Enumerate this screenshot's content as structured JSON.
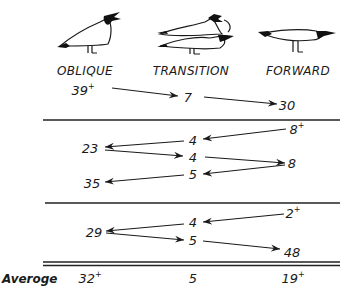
{
  "columns": [
    {
      "key": "oblique",
      "label": "OBLIQUE",
      "icon": "oblique-gull-icon"
    },
    {
      "key": "transition",
      "label": "TRANSITION",
      "icon": "transition-gull-icon"
    },
    {
      "key": "forward",
      "label": "FORWARD",
      "icon": "forward-gull-icon"
    }
  ],
  "blocks": [
    {
      "nodes": [
        {
          "id": "b1_obl",
          "value": "39",
          "sup": "+",
          "column": "oblique"
        },
        {
          "id": "b1_tr",
          "value": "7",
          "sup": "",
          "column": "transition"
        },
        {
          "id": "b1_fw",
          "value": "30",
          "sup": "",
          "column": "forward"
        }
      ],
      "arrows": [
        {
          "from": "b1_obl",
          "to": "b1_tr"
        },
        {
          "from": "b1_tr",
          "to": "b1_fw"
        }
      ]
    },
    {
      "nodes": [
        {
          "id": "b2_fw1",
          "value": "8",
          "sup": "+",
          "column": "forward"
        },
        {
          "id": "b2_tr1",
          "value": "4",
          "sup": "",
          "column": "transition"
        },
        {
          "id": "b2_obl1",
          "value": "23",
          "sup": "",
          "column": "oblique"
        },
        {
          "id": "b2_tr2",
          "value": "4",
          "sup": "",
          "column": "transition"
        },
        {
          "id": "b2_fw2",
          "value": "8",
          "sup": "",
          "column": "forward"
        },
        {
          "id": "b2_tr3",
          "value": "5",
          "sup": "",
          "column": "transition"
        },
        {
          "id": "b2_obl2",
          "value": "35",
          "sup": "",
          "column": "oblique"
        }
      ],
      "arrows": [
        {
          "from": "b2_fw1",
          "to": "b2_tr1"
        },
        {
          "from": "b2_tr1",
          "to": "b2_obl1"
        },
        {
          "from": "b2_obl1",
          "to": "b2_tr2"
        },
        {
          "from": "b2_tr2",
          "to": "b2_fw2"
        },
        {
          "from": "b2_fw2",
          "to": "b2_tr3"
        },
        {
          "from": "b2_tr3",
          "to": "b2_obl2"
        }
      ]
    },
    {
      "nodes": [
        {
          "id": "b3_fw1",
          "value": "2",
          "sup": "+",
          "column": "forward"
        },
        {
          "id": "b3_tr1",
          "value": "4",
          "sup": "",
          "column": "transition"
        },
        {
          "id": "b3_obl",
          "value": "29",
          "sup": "",
          "column": "oblique"
        },
        {
          "id": "b3_tr2",
          "value": "5",
          "sup": "",
          "column": "transition"
        },
        {
          "id": "b3_fw2",
          "value": "48",
          "sup": "",
          "column": "forward"
        }
      ],
      "arrows": [
        {
          "from": "b3_fw1",
          "to": "b3_tr1"
        },
        {
          "from": "b3_tr1",
          "to": "b3_obl"
        },
        {
          "from": "b3_obl",
          "to": "b3_tr2"
        },
        {
          "from": "b3_tr2",
          "to": "b3_fw2"
        }
      ]
    }
  ],
  "average": {
    "label": "Averoge",
    "oblique": {
      "value": "32",
      "sup": "+"
    },
    "transition": {
      "value": "5",
      "sup": ""
    },
    "forward": {
      "value": "19",
      "sup": "+"
    }
  },
  "colors": {
    "ink": "#1a1a1a",
    "background": "#ffffff"
  }
}
